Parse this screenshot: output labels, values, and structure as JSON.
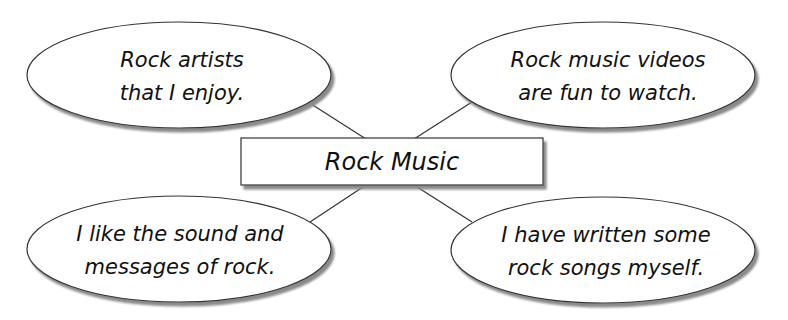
{
  "diagram": {
    "type": "idea-web",
    "center": {
      "label": "Rock Music"
    },
    "bubbles": [
      {
        "position": "top-left",
        "lines": [
          "Rock artists",
          "that I enjoy."
        ]
      },
      {
        "position": "top-right",
        "lines": [
          "Rock music videos",
          "are fun to watch."
        ]
      },
      {
        "position": "bottom-left",
        "lines": [
          "I like the sound and",
          "messages of rock."
        ]
      },
      {
        "position": "bottom-right",
        "lines": [
          "I have written some",
          "rock songs myself."
        ]
      }
    ],
    "colors": {
      "stroke": "#333333",
      "fill": "#ffffff",
      "shadow": "#9a9a9a",
      "text": "#111111"
    }
  }
}
